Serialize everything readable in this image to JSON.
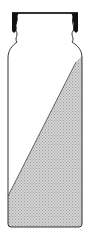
{
  "figure": {
    "fill_fraction_right": 0.92,
    "fill_fraction_left": 0.18,
    "colors": {
      "outline": "#333333",
      "cap_fill": "#111111",
      "liquid_fill": "#c8c8c8",
      "background": "#ffffff"
    }
  }
}
